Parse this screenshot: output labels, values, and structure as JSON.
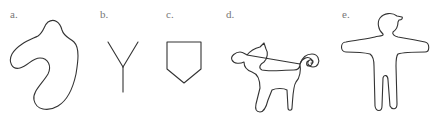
{
  "figure": {
    "panels": [
      {
        "label": "a.",
        "shape": "irregular-blob"
      },
      {
        "label": "b.",
        "shape": "y-fork"
      },
      {
        "label": "c.",
        "shape": "pentagon-shield"
      },
      {
        "label": "d.",
        "shape": "animal-outline"
      },
      {
        "label": "e.",
        "shape": "human-figure-outline"
      }
    ],
    "stroke_color": "#333333",
    "label_color": "#777777",
    "background": "#ffffff"
  }
}
